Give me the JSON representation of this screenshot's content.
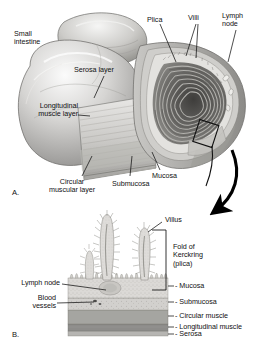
{
  "figure": {
    "background_color": "#ffffff",
    "ink_color": "#111111"
  },
  "panel_a": {
    "marker": "A.",
    "caption": "Cut-away view of a segment of small intestine",
    "labels": {
      "small_intestine": "Small\nintestine",
      "serosa_layer": "Serosa layer",
      "longitudinal_muscle_layer": "Longitudinal\nmuscle layer",
      "circular_muscular_layer": "Circular\nmuscular layer",
      "submucosa": "Submucosa",
      "mucosa": "Mucosa",
      "plica": "Plica",
      "villi": "Villi",
      "lymph_node": "Lymph\nnode"
    },
    "magnifier_box": {
      "name": "magnification-region-box",
      "description": "Small rotated rectangle marking the region enlarged in panel B"
    }
  },
  "panel_b": {
    "marker": "B.",
    "caption": "Magnified cross-section of the intestinal wall",
    "labels": {
      "villus": "Villus",
      "fold_of_kerckring": "Fold of\nKerckring\n(plica)",
      "lymph_node": "Lymph node",
      "blood_vessels": "Blood\nvessels",
      "mucosa": "- Mucosa",
      "submucosa": "- Submucosa",
      "circular_muscle": "- Circular muscle",
      "longitudinal_muscle": "- Longitudinal muscle",
      "serosa": "- Serosa"
    },
    "layers": [
      {
        "name": "mucosa",
        "label": "- Mucosa",
        "color": "#d8d6d2"
      },
      {
        "name": "submucosa",
        "label": "- Submucosa",
        "color": "#cdcbc7"
      },
      {
        "name": "circular-muscle",
        "label": "- Circular muscle",
        "color": "#a9a8a5"
      },
      {
        "name": "longitudinal-muscle",
        "label": "- Longitudinal muscle",
        "color": "#8d8c8a"
      },
      {
        "name": "serosa",
        "label": "- Serosa",
        "color": "#b6b5b2"
      }
    ]
  },
  "connector": {
    "name": "magnification-arrow",
    "description": "Large curved arrow leading from the boxed region in panel A down to panel B"
  }
}
